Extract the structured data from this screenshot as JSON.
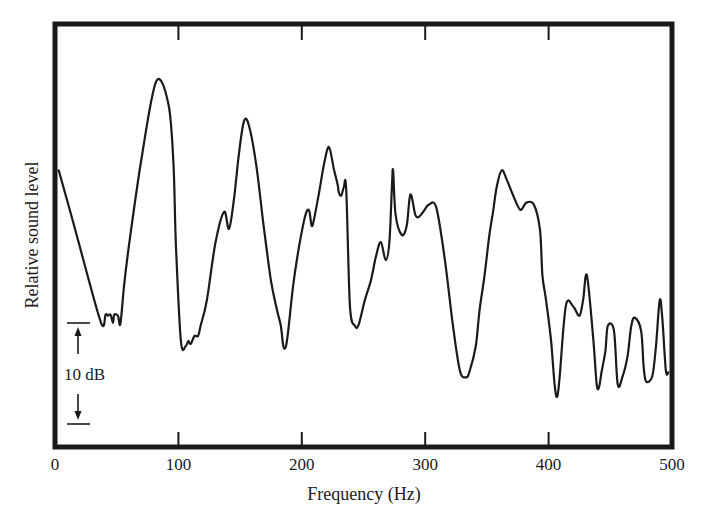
{
  "chart_data": {
    "type": "line",
    "title": "",
    "xlabel": "Frequency (Hz)",
    "ylabel": "Relative sound level",
    "xlim": [
      0,
      500
    ],
    "ylim_db_relative": [
      0,
      42
    ],
    "x_ticks": [
      0,
      100,
      200,
      300,
      400,
      500
    ],
    "x_tick_labels": [
      "0",
      "100",
      "200",
      "300",
      "400",
      "500"
    ],
    "grid": false,
    "legend": null,
    "scale_bar": {
      "label": "10 dB",
      "db": 10
    },
    "series": [
      {
        "name": "Relative sound level",
        "color": "#1a1a1a",
        "x": [
          3,
          16,
          27,
          38,
          41,
          43,
          45,
          47,
          48,
          51,
          53,
          56,
          60,
          70,
          82,
          92,
          96,
          98,
          102,
          106,
          108,
          110,
          113,
          116,
          118,
          123,
          130,
          137,
          141,
          145,
          149,
          153,
          157,
          163,
          169,
          175,
          180,
          183,
          185,
          187,
          189,
          193,
          198,
          203,
          206,
          208,
          210,
          214,
          218,
          222,
          226,
          229,
          230,
          232,
          234,
          236,
          239,
          243,
          246,
          251,
          256,
          260,
          264,
          268,
          271,
          273,
          274,
          276,
          281,
          285,
          288,
          292,
          295,
          299,
          303,
          309,
          316,
          322,
          328,
          333,
          336,
          341,
          344,
          348,
          352,
          355,
          358,
          362,
          366,
          371,
          377,
          382,
          388,
          393,
          395,
          398,
          402,
          405,
          407,
          409,
          414,
          420,
          425,
          428,
          431,
          436,
          439,
          441,
          443,
          446,
          448,
          453,
          456,
          460,
          464,
          467,
          470,
          475,
          477,
          479,
          484,
          487,
          490,
          492,
          495,
          497
        ],
        "y_db": [
          27.4,
          21.7,
          16.7,
          12.1,
          13.1,
          13.0,
          13.1,
          12.3,
          13.1,
          13.0,
          12.2,
          16.0,
          20.0,
          28.5,
          36.2,
          33.9,
          28.0,
          20.0,
          10.5,
          10.0,
          10.5,
          10.2,
          11.0,
          11.0,
          12.0,
          14.5,
          20.2,
          23.3,
          21.6,
          24.5,
          29.0,
          32.2,
          31.9,
          28.0,
          22.0,
          16.5,
          13.5,
          12.0,
          10.0,
          9.9,
          11.5,
          16.0,
          20.0,
          23.0,
          23.4,
          21.9,
          22.6,
          25.2,
          28.0,
          29.7,
          27.5,
          26.0,
          25.2,
          24.9,
          25.7,
          25.5,
          14.0,
          12.0,
          12.1,
          14.5,
          16.5,
          18.8,
          20.3,
          18.5,
          20.3,
          25.7,
          27.4,
          23.0,
          21.0,
          21.9,
          25.0,
          23.0,
          22.8,
          23.4,
          24.0,
          23.7,
          18.5,
          12.5,
          7.6,
          6.9,
          7.5,
          10.0,
          13.5,
          16.9,
          21.0,
          23.3,
          25.8,
          27.4,
          26.5,
          25.0,
          23.5,
          24.2,
          24.0,
          21.5,
          17.0,
          14.5,
          10.5,
          6.0,
          5.0,
          7.0,
          14.0,
          13.9,
          13.0,
          14.6,
          17.0,
          11.0,
          6.2,
          6.0,
          7.5,
          9.5,
          12.0,
          11.5,
          6.2,
          7.0,
          9.0,
          12.0,
          12.8,
          11.5,
          8.0,
          6.5,
          7.0,
          10.0,
          14.5,
          13.0,
          7.6,
          7.4,
          8.0
        ]
      }
    ]
  },
  "plot": {
    "x_axis_title": "Frequency (Hz)",
    "y_axis_title": "Relative sound level",
    "scale_bar_label": "10 dB",
    "tick_labels": [
      "0",
      "100",
      "200",
      "300",
      "400",
      "500"
    ]
  }
}
